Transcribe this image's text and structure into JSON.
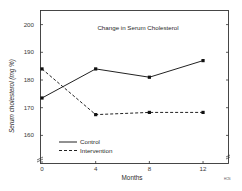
{
  "chart_data": {
    "type": "line",
    "title": "Change in Serum Cholesterol",
    "xlabel": "Months",
    "ylabel": "Serum cholesterol (mg %)",
    "x": [
      0,
      4,
      8,
      12
    ],
    "x_tick_labels": [
      "0",
      "4",
      "8",
      "12"
    ],
    "y_tick_labels": [
      "160",
      "170",
      "180",
      "190",
      "200"
    ],
    "ylim": [
      150,
      205
    ],
    "xlim": [
      0,
      14
    ],
    "grid": false,
    "legend_position": "lower left",
    "series": [
      {
        "name": "Control",
        "style": "solid",
        "values": [
          173.5,
          184,
          181,
          187
        ]
      },
      {
        "name": "Intervention",
        "style": "dashed",
        "values": [
          184,
          167.5,
          168.3,
          168.3
        ]
      }
    ],
    "annotations": [
      "axis break marks at origin",
      "small figure id mark lower right"
    ]
  },
  "legend": {
    "control": "Control",
    "intervention": "Intervention"
  },
  "figure_note": "HCN"
}
